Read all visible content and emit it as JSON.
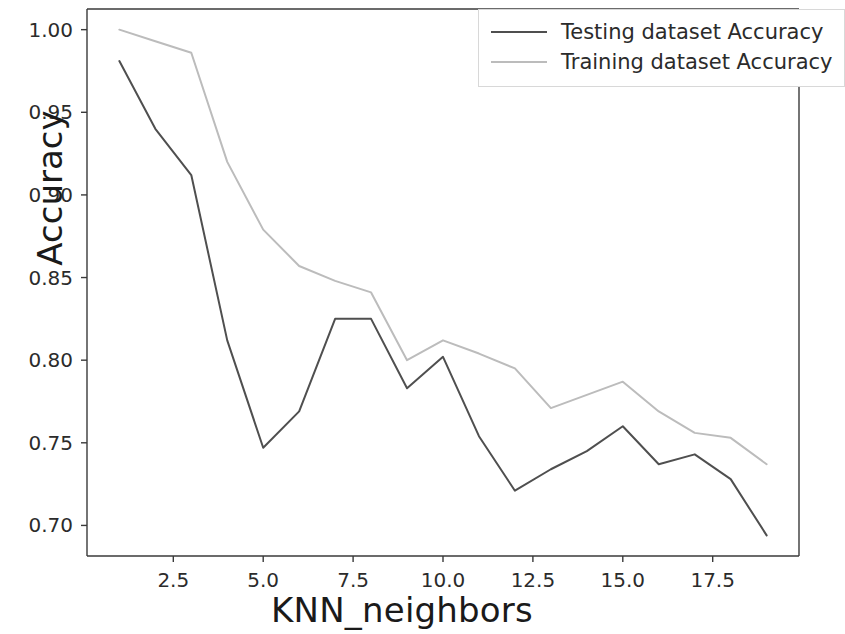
{
  "chart_data": {
    "type": "line",
    "title": "",
    "xlabel": "KNN_neighbors",
    "ylabel": "Accuracy",
    "xlim": [
      0.1,
      19.9
    ],
    "ylim": [
      0.6815,
      1.0125
    ],
    "grid": false,
    "legend_position": "upper right",
    "xticks": [
      "2.5",
      "5.0",
      "7.5",
      "10.0",
      "12.5",
      "15.0",
      "17.5"
    ],
    "xtick_values": [
      2.5,
      5.0,
      7.5,
      10.0,
      12.5,
      15.0,
      17.5
    ],
    "yticks": [
      "0.70",
      "0.75",
      "0.80",
      "0.85",
      "0.90",
      "0.95",
      "1.00"
    ],
    "ytick_values": [
      0.7,
      0.75,
      0.8,
      0.85,
      0.9,
      0.95,
      1.0
    ],
    "x": [
      1,
      2,
      3,
      4,
      5,
      6,
      7,
      8,
      9,
      10,
      11,
      12,
      13,
      14,
      15,
      16,
      17,
      18,
      19
    ],
    "series": [
      {
        "name": "Testing dataset Accuracy",
        "color": "#4f4f4f",
        "values": [
          0.981,
          0.94,
          0.912,
          0.812,
          0.747,
          0.769,
          0.825,
          0.825,
          0.783,
          0.802,
          0.754,
          0.721,
          0.734,
          0.745,
          0.76,
          0.737,
          0.743,
          0.728,
          0.694
        ]
      },
      {
        "name": "Training dataset Accuracy",
        "color": "#bcbcbc",
        "values": [
          1.0,
          0.993,
          0.986,
          0.92,
          0.879,
          0.857,
          0.848,
          0.841,
          0.8,
          0.812,
          0.804,
          0.795,
          0.771,
          0.779,
          0.787,
          0.769,
          0.756,
          0.753,
          0.737
        ]
      }
    ]
  },
  "legend": {
    "entries": [
      {
        "label": "Testing dataset Accuracy"
      },
      {
        "label": "Training dataset Accuracy"
      }
    ]
  },
  "axes": {
    "spine_color": "#3a3a3a",
    "background": "#ffffff"
  }
}
